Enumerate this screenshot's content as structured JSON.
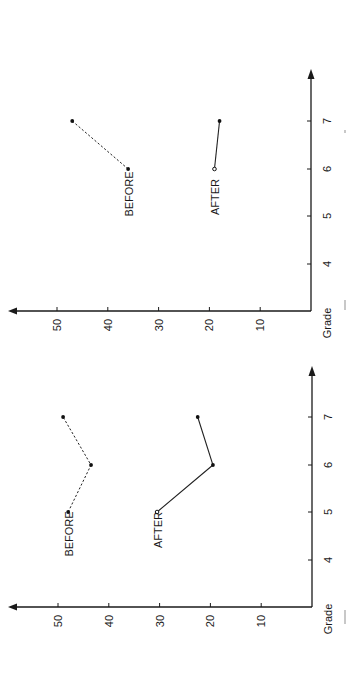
{
  "chart_data": [
    {
      "type": "line",
      "orientation": "rotated-90-ccw",
      "panel": "top",
      "title": "",
      "xlabel": "Grade",
      "ylabel": "",
      "categories": [
        4,
        5,
        6,
        7
      ],
      "x_ticks": [
        "4",
        "5",
        "6",
        "7"
      ],
      "y_ticks": [
        "10",
        "20",
        "30",
        "40",
        "50"
      ],
      "ylim": [
        0,
        58
      ],
      "grid": false,
      "legend": "inline labels",
      "series": [
        {
          "name": "BEFORE",
          "style": "dashed",
          "marker": "filled",
          "x": [
            6,
            7
          ],
          "values": [
            36,
            47
          ]
        },
        {
          "name": "AFTER",
          "style": "solid",
          "marker": "open-then-filled",
          "x": [
            6,
            7
          ],
          "values": [
            19,
            18
          ]
        }
      ]
    },
    {
      "type": "line",
      "orientation": "rotated-90-ccw",
      "panel": "bottom",
      "title": "",
      "xlabel": "Grade",
      "ylabel": "",
      "categories": [
        4,
        5,
        6,
        7
      ],
      "x_ticks": [
        "4",
        "5",
        "6",
        "7"
      ],
      "y_ticks": [
        "10",
        "20",
        "30",
        "40",
        "50"
      ],
      "ylim": [
        0,
        58
      ],
      "grid": false,
      "legend": "inline labels",
      "series": [
        {
          "name": "BEFORE",
          "style": "dashed",
          "marker": "filled",
          "x": [
            5,
            6,
            7
          ],
          "values": [
            48,
            43.5,
            49
          ]
        },
        {
          "name": "AFTER",
          "style": "solid",
          "marker": "open-then-filled",
          "x": [
            5,
            6,
            7
          ],
          "values": [
            30.5,
            19.5,
            22.5
          ]
        }
      ]
    }
  ],
  "panels": [
    {
      "id": "top",
      "layout": {
        "originX": 311,
        "originY": 311,
        "pxPerUnit": 5.08,
        "gradeY": {
          "4": 264,
          "5": 216,
          "6": 169,
          "7": 121
        },
        "arrowValueX": 8,
        "arrowGradeY": 69
      },
      "labels": [
        {
          "text": "BEFORE",
          "cx": 129,
          "cy": 194
        },
        {
          "text": "AFTER",
          "cx": 215,
          "cy": 197
        }
      ]
    },
    {
      "id": "bottom",
      "layout": {
        "originX": 312,
        "originY": 607,
        "pxPerUnit": 5.08,
        "gradeY": {
          "4": 560,
          "5": 512,
          "6": 465,
          "7": 417
        },
        "arrowValueX": 8,
        "arrowGradeY": 366
      },
      "labels": [
        {
          "text": "BEFORE",
          "cx": 69,
          "cy": 534
        },
        {
          "text": "AFTER",
          "cx": 158,
          "cy": 530
        }
      ]
    }
  ]
}
